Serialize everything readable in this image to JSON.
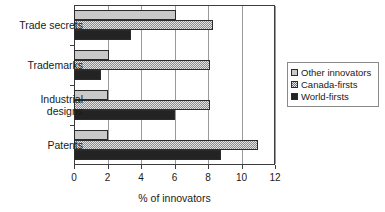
{
  "chart_data": {
    "type": "bar",
    "orientation": "horizontal",
    "title": "",
    "subtitle": "",
    "xlabel": "% of innovators",
    "ylabel": "",
    "xlim": [
      0,
      12
    ],
    "xticks": [
      0,
      2,
      4,
      6,
      8,
      10,
      12
    ],
    "xtick_labels": [
      "0",
      "2",
      "4",
      "6",
      "8",
      "10",
      "12"
    ],
    "grid": true,
    "grid_axis": "x",
    "legend_position": "right",
    "categories": [
      "Trade secrets",
      "Trademarks",
      "Industrial designs",
      "Patents"
    ],
    "category_labels_multiline": [
      "Trade secrets",
      "Trademarks",
      "Industrial\ndesigns",
      "Patents"
    ],
    "series": [
      {
        "name": "Other innovators",
        "key": "other",
        "fill": "light-gray-solid",
        "color": "#c9c9c9",
        "values": [
          6.1,
          2.1,
          2.0,
          2.0
        ]
      },
      {
        "name": "Canada-firsts",
        "key": "canada",
        "fill": "checkerboard-hatch",
        "color": "#8c8c8c",
        "values": [
          8.3,
          8.1,
          8.1,
          11.0
        ]
      },
      {
        "name": "World-firsts",
        "key": "world",
        "fill": "solid-dark",
        "color": "#232323",
        "values": [
          3.4,
          1.6,
          6.0,
          8.8
        ]
      }
    ]
  },
  "axes": {
    "x_title": "% of innovators",
    "tick_labels": [
      "0",
      "2",
      "4",
      "6",
      "8",
      "10",
      "12"
    ],
    "category_labels": [
      "Trade secrets",
      "Trademarks",
      "Industrial\ndesigns",
      "Patents"
    ]
  },
  "legend": {
    "entries": [
      {
        "label": "Other innovators",
        "swatch": "light-gray-swatch"
      },
      {
        "label": "Canada-firsts",
        "swatch": "checker-swatch"
      },
      {
        "label": "World-firsts",
        "swatch": "dark-swatch"
      }
    ]
  }
}
